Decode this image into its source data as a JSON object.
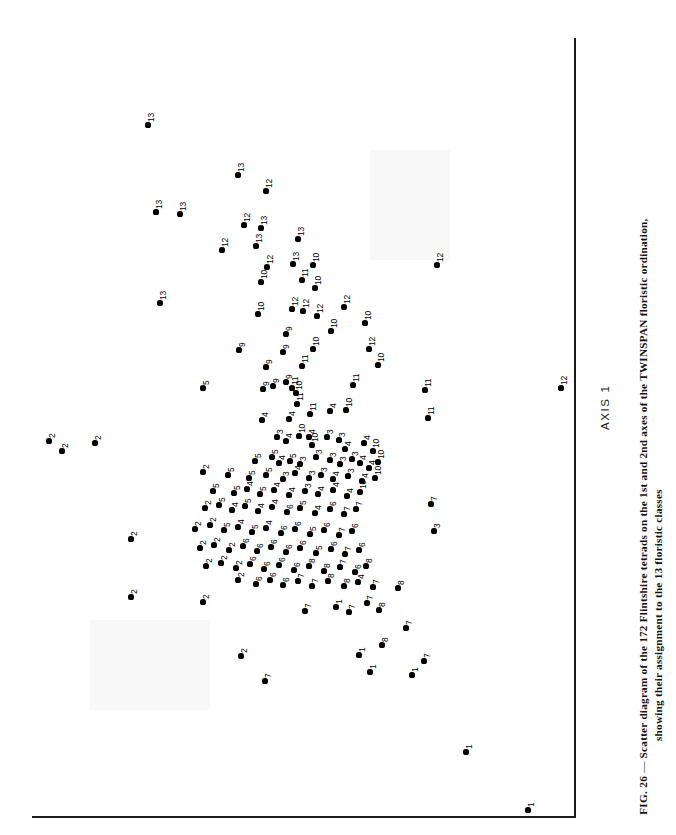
{
  "figure": {
    "axis1_label": "AXIS 1",
    "caption_figure_number": "FIG. 26",
    "caption_dash": "—",
    "caption_line1": "Scatter diagram of the 172 Flintshire tetrads on the 1st and 2nd axes of the TWINSPAN floristic ordination,",
    "caption_line2": "showing their assignment to the 13 floristic classes"
  },
  "chart_data": {
    "type": "scatter",
    "title": "Scatter diagram of the 172 Flintshire tetrads on the 1st and 2nd axes of the TWINSPAN floristic ordination, showing their assignment to the 13 floristic classes",
    "xlabel": "AXIS 1",
    "ylabel": "AXIS 2",
    "grid": false,
    "legend": "none",
    "point_label_meaning": "floristic class number (1-13)",
    "n_points": 172,
    "orientation_note": "figure is printed rotated 90 degrees; AXIS 1 runs vertically up the page",
    "classes": [
      1,
      2,
      3,
      4,
      5,
      6,
      7,
      8,
      9,
      10,
      11,
      12,
      13
    ],
    "points": [
      {
        "x": 148,
        "y": 125,
        "label": "13"
      },
      {
        "x": 238,
        "y": 175,
        "label": "13"
      },
      {
        "x": 266,
        "y": 191,
        "label": "12"
      },
      {
        "x": 156,
        "y": 212,
        "label": "13"
      },
      {
        "x": 180,
        "y": 214,
        "label": "13"
      },
      {
        "x": 244,
        "y": 225,
        "label": "12"
      },
      {
        "x": 261,
        "y": 228,
        "label": "13"
      },
      {
        "x": 222,
        "y": 250,
        "label": "12"
      },
      {
        "x": 256,
        "y": 246,
        "label": "13"
      },
      {
        "x": 298,
        "y": 239,
        "label": "13"
      },
      {
        "x": 267,
        "y": 267,
        "label": "12"
      },
      {
        "x": 293,
        "y": 264,
        "label": "13"
      },
      {
        "x": 313,
        "y": 265,
        "label": "10"
      },
      {
        "x": 160,
        "y": 303,
        "label": "13"
      },
      {
        "x": 261,
        "y": 282,
        "label": "10"
      },
      {
        "x": 302,
        "y": 280,
        "label": "11"
      },
      {
        "x": 315,
        "y": 288,
        "label": "10"
      },
      {
        "x": 437,
        "y": 265,
        "label": "12"
      },
      {
        "x": 258,
        "y": 314,
        "label": "10"
      },
      {
        "x": 292,
        "y": 309,
        "label": "12"
      },
      {
        "x": 303,
        "y": 311,
        "label": "12"
      },
      {
        "x": 317,
        "y": 316,
        "label": "12"
      },
      {
        "x": 344,
        "y": 307,
        "label": "12"
      },
      {
        "x": 286,
        "y": 334,
        "label": "9"
      },
      {
        "x": 331,
        "y": 331,
        "label": "10"
      },
      {
        "x": 365,
        "y": 323,
        "label": "10"
      },
      {
        "x": 239,
        "y": 350,
        "label": "9"
      },
      {
        "x": 283,
        "y": 352,
        "label": "9"
      },
      {
        "x": 313,
        "y": 349,
        "label": "10"
      },
      {
        "x": 369,
        "y": 349,
        "label": "12"
      },
      {
        "x": 203,
        "y": 388,
        "label": "5"
      },
      {
        "x": 266,
        "y": 367,
        "label": "9"
      },
      {
        "x": 302,
        "y": 366,
        "label": "11"
      },
      {
        "x": 378,
        "y": 365,
        "label": "10"
      },
      {
        "x": 561,
        "y": 388,
        "label": "12"
      },
      {
        "x": 263,
        "y": 389,
        "label": "9"
      },
      {
        "x": 273,
        "y": 386,
        "label": "9"
      },
      {
        "x": 286,
        "y": 382,
        "label": "9"
      },
      {
        "x": 292,
        "y": 388,
        "label": "11"
      },
      {
        "x": 296,
        "y": 393,
        "label": "10"
      },
      {
        "x": 353,
        "y": 385,
        "label": "11"
      },
      {
        "x": 297,
        "y": 404,
        "label": "11"
      },
      {
        "x": 425,
        "y": 390,
        "label": "11"
      },
      {
        "x": 262,
        "y": 420,
        "label": "4"
      },
      {
        "x": 289,
        "y": 419,
        "label": "4"
      },
      {
        "x": 310,
        "y": 414,
        "label": "11"
      },
      {
        "x": 330,
        "y": 411,
        "label": "4"
      },
      {
        "x": 346,
        "y": 410,
        "label": "10"
      },
      {
        "x": 428,
        "y": 418,
        "label": "11"
      },
      {
        "x": 49,
        "y": 441,
        "label": "2"
      },
      {
        "x": 62,
        "y": 451,
        "label": "2"
      },
      {
        "x": 95,
        "y": 443,
        "label": "2"
      },
      {
        "x": 277,
        "y": 437,
        "label": "3"
      },
      {
        "x": 286,
        "y": 441,
        "label": "4"
      },
      {
        "x": 299,
        "y": 436,
        "label": "10"
      },
      {
        "x": 309,
        "y": 437,
        "label": "4"
      },
      {
        "x": 312,
        "y": 445,
        "label": "10"
      },
      {
        "x": 327,
        "y": 437,
        "label": "3"
      },
      {
        "x": 339,
        "y": 440,
        "label": "3"
      },
      {
        "x": 345,
        "y": 449,
        "label": "4"
      },
      {
        "x": 364,
        "y": 443,
        "label": "4"
      },
      {
        "x": 373,
        "y": 451,
        "label": "10"
      },
      {
        "x": 255,
        "y": 461,
        "label": "5"
      },
      {
        "x": 272,
        "y": 457,
        "label": "5"
      },
      {
        "x": 279,
        "y": 463,
        "label": "4"
      },
      {
        "x": 290,
        "y": 461,
        "label": "5"
      },
      {
        "x": 300,
        "y": 464,
        "label": "3"
      },
      {
        "x": 316,
        "y": 457,
        "label": "3"
      },
      {
        "x": 330,
        "y": 460,
        "label": "3"
      },
      {
        "x": 340,
        "y": 464,
        "label": "3"
      },
      {
        "x": 352,
        "y": 459,
        "label": "3"
      },
      {
        "x": 360,
        "y": 463,
        "label": "4"
      },
      {
        "x": 369,
        "y": 468,
        "label": "4"
      },
      {
        "x": 378,
        "y": 462,
        "label": "10"
      },
      {
        "x": 203,
        "y": 472,
        "label": "2"
      },
      {
        "x": 228,
        "y": 475,
        "label": "5"
      },
      {
        "x": 249,
        "y": 478,
        "label": "5"
      },
      {
        "x": 266,
        "y": 475,
        "label": "5"
      },
      {
        "x": 283,
        "y": 479,
        "label": "3"
      },
      {
        "x": 295,
        "y": 473,
        "label": "4"
      },
      {
        "x": 309,
        "y": 478,
        "label": "3"
      },
      {
        "x": 321,
        "y": 475,
        "label": "3"
      },
      {
        "x": 333,
        "y": 479,
        "label": "4"
      },
      {
        "x": 348,
        "y": 476,
        "label": "3"
      },
      {
        "x": 362,
        "y": 481,
        "label": "4"
      },
      {
        "x": 375,
        "y": 478,
        "label": "10"
      },
      {
        "x": 213,
        "y": 491,
        "label": "5"
      },
      {
        "x": 234,
        "y": 493,
        "label": "5"
      },
      {
        "x": 247,
        "y": 489,
        "label": "4"
      },
      {
        "x": 260,
        "y": 494,
        "label": "5"
      },
      {
        "x": 274,
        "y": 490,
        "label": "4"
      },
      {
        "x": 289,
        "y": 495,
        "label": "4"
      },
      {
        "x": 305,
        "y": 491,
        "label": "3"
      },
      {
        "x": 318,
        "y": 494,
        "label": "4"
      },
      {
        "x": 333,
        "y": 490,
        "label": "4"
      },
      {
        "x": 347,
        "y": 496,
        "label": "4"
      },
      {
        "x": 360,
        "y": 492,
        "label": "10"
      },
      {
        "x": 131,
        "y": 539,
        "label": "2"
      },
      {
        "x": 205,
        "y": 508,
        "label": "2"
      },
      {
        "x": 219,
        "y": 505,
        "label": "5"
      },
      {
        "x": 232,
        "y": 510,
        "label": "4"
      },
      {
        "x": 245,
        "y": 506,
        "label": "5"
      },
      {
        "x": 258,
        "y": 511,
        "label": "4"
      },
      {
        "x": 272,
        "y": 507,
        "label": "4"
      },
      {
        "x": 287,
        "y": 512,
        "label": "6"
      },
      {
        "x": 300,
        "y": 508,
        "label": "5"
      },
      {
        "x": 315,
        "y": 513,
        "label": "4"
      },
      {
        "x": 330,
        "y": 509,
        "label": "6"
      },
      {
        "x": 344,
        "y": 514,
        "label": "7"
      },
      {
        "x": 356,
        "y": 509,
        "label": "7"
      },
      {
        "x": 434,
        "y": 531,
        "label": "3"
      },
      {
        "x": 195,
        "y": 529,
        "label": "2"
      },
      {
        "x": 210,
        "y": 525,
        "label": "2"
      },
      {
        "x": 224,
        "y": 530,
        "label": "5"
      },
      {
        "x": 238,
        "y": 527,
        "label": "4"
      },
      {
        "x": 252,
        "y": 532,
        "label": "5"
      },
      {
        "x": 266,
        "y": 528,
        "label": "4"
      },
      {
        "x": 281,
        "y": 533,
        "label": "6"
      },
      {
        "x": 295,
        "y": 529,
        "label": "6"
      },
      {
        "x": 310,
        "y": 534,
        "label": "5"
      },
      {
        "x": 324,
        "y": 530,
        "label": "6"
      },
      {
        "x": 339,
        "y": 535,
        "label": "7"
      },
      {
        "x": 352,
        "y": 531,
        "label": "6"
      },
      {
        "x": 431,
        "y": 504,
        "label": "7"
      },
      {
        "x": 200,
        "y": 548,
        "label": "2"
      },
      {
        "x": 214,
        "y": 545,
        "label": "2"
      },
      {
        "x": 229,
        "y": 550,
        "label": "2"
      },
      {
        "x": 243,
        "y": 546,
        "label": "6"
      },
      {
        "x": 257,
        "y": 551,
        "label": "6"
      },
      {
        "x": 271,
        "y": 547,
        "label": "6"
      },
      {
        "x": 286,
        "y": 552,
        "label": "6"
      },
      {
        "x": 300,
        "y": 548,
        "label": "6"
      },
      {
        "x": 316,
        "y": 553,
        "label": "5"
      },
      {
        "x": 331,
        "y": 549,
        "label": "6"
      },
      {
        "x": 345,
        "y": 554,
        "label": "7"
      },
      {
        "x": 359,
        "y": 550,
        "label": "6"
      },
      {
        "x": 206,
        "y": 566,
        "label": "2"
      },
      {
        "x": 221,
        "y": 563,
        "label": "2"
      },
      {
        "x": 236,
        "y": 568,
        "label": "2"
      },
      {
        "x": 250,
        "y": 564,
        "label": "6"
      },
      {
        "x": 264,
        "y": 569,
        "label": "6"
      },
      {
        "x": 279,
        "y": 565,
        "label": "6"
      },
      {
        "x": 294,
        "y": 570,
        "label": "6"
      },
      {
        "x": 309,
        "y": 566,
        "label": "8"
      },
      {
        "x": 324,
        "y": 571,
        "label": "8"
      },
      {
        "x": 340,
        "y": 567,
        "label": "7"
      },
      {
        "x": 355,
        "y": 572,
        "label": "6"
      },
      {
        "x": 366,
        "y": 566,
        "label": "8"
      },
      {
        "x": 131,
        "y": 597,
        "label": "2"
      },
      {
        "x": 203,
        "y": 602,
        "label": "2"
      },
      {
        "x": 238,
        "y": 580,
        "label": "2"
      },
      {
        "x": 256,
        "y": 584,
        "label": "6"
      },
      {
        "x": 270,
        "y": 580,
        "label": "6"
      },
      {
        "x": 283,
        "y": 585,
        "label": "6"
      },
      {
        "x": 298,
        "y": 581,
        "label": "7"
      },
      {
        "x": 312,
        "y": 586,
        "label": "7"
      },
      {
        "x": 328,
        "y": 581,
        "label": "8"
      },
      {
        "x": 344,
        "y": 586,
        "label": "8"
      },
      {
        "x": 358,
        "y": 582,
        "label": "4"
      },
      {
        "x": 373,
        "y": 587,
        "label": "7"
      },
      {
        "x": 398,
        "y": 588,
        "label": "8"
      },
      {
        "x": 305,
        "y": 611,
        "label": "7"
      },
      {
        "x": 336,
        "y": 607,
        "label": "1"
      },
      {
        "x": 349,
        "y": 612,
        "label": "7"
      },
      {
        "x": 367,
        "y": 603,
        "label": "7"
      },
      {
        "x": 379,
        "y": 610,
        "label": "8"
      },
      {
        "x": 241,
        "y": 656,
        "label": "2"
      },
      {
        "x": 265,
        "y": 681,
        "label": "7"
      },
      {
        "x": 359,
        "y": 655,
        "label": "1"
      },
      {
        "x": 370,
        "y": 672,
        "label": "1"
      },
      {
        "x": 382,
        "y": 645,
        "label": "8"
      },
      {
        "x": 406,
        "y": 628,
        "label": "7"
      },
      {
        "x": 412,
        "y": 675,
        "label": "1"
      },
      {
        "x": 424,
        "y": 661,
        "label": "7"
      },
      {
        "x": 466,
        "y": 752,
        "label": "1"
      },
      {
        "x": 528,
        "y": 810,
        "label": "1"
      }
    ]
  }
}
